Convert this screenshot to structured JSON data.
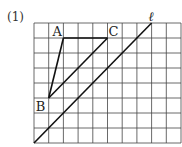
{
  "problem": {
    "number_label": "(1)"
  },
  "grid": {
    "cols": 10,
    "rows": 8,
    "left": 34,
    "top": 23,
    "cell_w": 14.7,
    "cell_h": 15,
    "line_color": "#333333"
  },
  "points": {
    "A": {
      "label": "A",
      "col": 2,
      "row": 1
    },
    "B": {
      "label": "B",
      "col": 1,
      "row": 5
    },
    "C": {
      "label": "C",
      "col": 5,
      "row": 1
    }
  },
  "line_l": {
    "label": "ℓ",
    "from": {
      "col": 0,
      "row": 8
    },
    "to": {
      "col": 8,
      "row": 0
    }
  },
  "segments": [
    [
      "A",
      "B"
    ],
    [
      "A",
      "C"
    ],
    [
      "B",
      "C"
    ]
  ]
}
